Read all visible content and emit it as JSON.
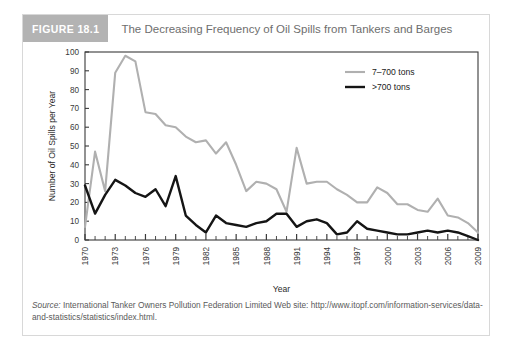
{
  "figure": {
    "badge": "FIGURE 18.1",
    "title": "The Decreasing Frequency of Oil Spills from Tankers and Barges"
  },
  "source": {
    "label": "Source:",
    "text": " International Tanker Owners Pollution Federation Limited Web site: http://www.itopf.com/information-services/data-and-statistics/statistics/index.html."
  },
  "chart_data": {
    "type": "line",
    "title": "The Decreasing Frequency of Oil Spills from Tankers and Barges",
    "xlabel": "Year",
    "ylabel": "Number of Oil Spills per Year",
    "xlim": [
      1970,
      2009
    ],
    "ylim": [
      0,
      100
    ],
    "ytick_step": 10,
    "yticks": [
      0,
      10,
      20,
      30,
      40,
      50,
      60,
      70,
      80,
      90,
      100
    ],
    "xticks": [
      1970,
      1973,
      1976,
      1979,
      1982,
      1985,
      1988,
      1991,
      1994,
      1997,
      2000,
      2003,
      2006,
      2009
    ],
    "xtick_labels": [
      "1970",
      "1973",
      "1976",
      "1979",
      "1982",
      "1985",
      "1988",
      "1991",
      "1994",
      "1997",
      "2000",
      "2003",
      "2006",
      "2009"
    ],
    "xtick_rotation": -90,
    "minor_xticks_every": 1,
    "grid": false,
    "legend_position": "top-right",
    "x": [
      1970,
      1971,
      1972,
      1973,
      1974,
      1975,
      1976,
      1977,
      1978,
      1979,
      1980,
      1981,
      1982,
      1983,
      1984,
      1985,
      1986,
      1987,
      1988,
      1989,
      1990,
      1991,
      1992,
      1993,
      1994,
      1995,
      1996,
      1997,
      1998,
      1999,
      2000,
      2001,
      2002,
      2003,
      2004,
      2005,
      2006,
      2007,
      2008,
      2009
    ],
    "series": [
      {
        "name": "7-700 tons",
        "label": "7–700 tons",
        "color": "#b0b0b0",
        "width": 2.1,
        "values": [
          7,
          47,
          26,
          89,
          98,
          95,
          68,
          67,
          61,
          60,
          55,
          52,
          53,
          46,
          52,
          40,
          26,
          31,
          30,
          27,
          15,
          49,
          30,
          31,
          31,
          27,
          24,
          20,
          20,
          28,
          25,
          19,
          19,
          16,
          15,
          22,
          13,
          12,
          9,
          4
        ]
      },
      {
        "name": ">700 tons",
        "label": ">700 tons",
        "color": "#151515",
        "width": 2.4,
        "values": [
          29,
          14,
          24,
          32,
          29,
          25,
          23,
          27,
          18,
          34,
          13,
          8,
          4,
          13,
          9,
          8,
          7,
          9,
          10,
          14,
          14,
          7,
          10,
          11,
          9,
          3,
          4,
          10,
          6,
          5,
          4,
          3,
          3,
          4,
          5,
          4,
          5,
          4,
          2,
          0
        ]
      }
    ]
  }
}
